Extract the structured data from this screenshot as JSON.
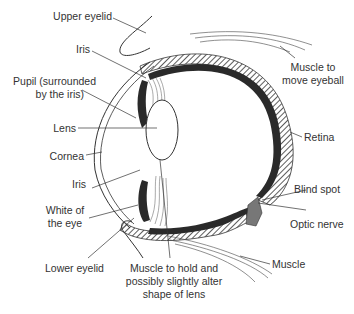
{
  "diagram": {
    "colors": {
      "line": "#3a3a3a",
      "label": "#333333",
      "dark_tissue": "#2a2a2a",
      "shade": "#777777",
      "background": "#ffffff"
    },
    "labels": {
      "upper_eyelid": "Upper eyelid",
      "iris_top": "Iris",
      "pupil_line1": "Pupil (surrounded",
      "pupil_line2": "by the iris)",
      "lens": "Lens",
      "cornea": "Cornea",
      "iris_bottom": "Iris",
      "white_line1": "White of",
      "white_line2": "the eye",
      "lower_eyelid": "Lower eyelid",
      "ciliary_line1": "Muscle to hold and",
      "ciliary_line2": "possibly slightly alter",
      "ciliary_line3": "shape of lens",
      "muscle_eyeball_line1": "Muscle to",
      "muscle_eyeball_line2": "move eyeball",
      "retina": "Retina",
      "blind_spot": "Blind spot",
      "optic_nerve": "Optic nerve",
      "muscle": "Muscle"
    }
  }
}
